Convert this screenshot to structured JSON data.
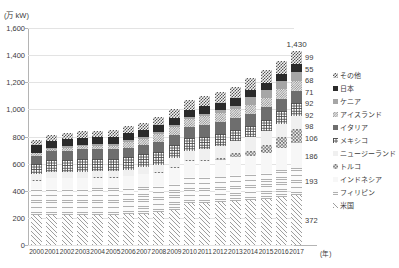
{
  "top_bleed_text": "",
  "axis": {
    "y_unit_label": "(万 kW)",
    "x_unit_label": "(年)",
    "y_ticks": [
      "0",
      "200",
      "400",
      "600",
      "800",
      "1,000",
      "1,200",
      "1,400",
      "1,600"
    ]
  },
  "annotations": {
    "total_2017": "1,430"
  },
  "legend": {
    "items": [
      {
        "label": "その他",
        "swatch": "p-sonota"
      },
      {
        "label": "日本",
        "swatch": "p-nihon"
      },
      {
        "label": "ケニア",
        "swatch": "p-kenya"
      },
      {
        "label": "アイスランド",
        "swatch": "p-iceland"
      },
      {
        "label": "イタリア",
        "swatch": "p-italy"
      },
      {
        "label": "メキシコ",
        "swatch": "p-mexico"
      },
      {
        "label": "ニュージーランド",
        "swatch": "p-nz"
      },
      {
        "label": "トルコ",
        "swatch": "p-turkey"
      },
      {
        "label": "インドネシア",
        "swatch": "p-indonesia"
      },
      {
        "label": "フィリピン",
        "swatch": "p-philippines"
      },
      {
        "label": "米国",
        "swatch": "p-usa"
      }
    ]
  },
  "callouts_2017": [
    "99",
    "55",
    "68",
    "71",
    "92",
    "92",
    "98",
    "106",
    "186",
    "193",
    "372"
  ],
  "chart_data": {
    "type": "bar",
    "title": "",
    "subtitle": "",
    "xlabel": "(年)",
    "ylabel": "(万 kW)",
    "ylim": [
      0,
      1600
    ],
    "ytick_step": 200,
    "grid": true,
    "stacked": true,
    "legend_position": "right",
    "categories": [
      "2000",
      "2001",
      "2002",
      "2003",
      "2004",
      "2005",
      "2006",
      "2007",
      "2008",
      "2009",
      "2010",
      "2011",
      "2012",
      "2013",
      "2014",
      "2015",
      "2016",
      "2017"
    ],
    "series": [
      {
        "name": "米国",
        "swatch": "p-usa",
        "values": [
          223,
          223,
          223,
          223,
          224,
          224,
          228,
          232,
          240,
          257,
          310,
          310,
          314,
          324,
          332,
          342,
          357,
          372
        ]
      },
      {
        "name": "フィリピン",
        "swatch": "p-philippines",
        "values": [
          193,
          193,
          193,
          193,
          193,
          193,
          193,
          193,
          193,
          193,
          190,
          190,
          190,
          190,
          190,
          192,
          193,
          193
        ]
      },
      {
        "name": "インドネシア",
        "swatch": "p-indonesia",
        "values": [
          59,
          79,
          79,
          79,
          80,
          80,
          85,
          99,
          99,
          119,
          119,
          119,
          124,
          134,
          134,
          144,
          164,
          186
        ]
      },
      {
        "name": "トルコ",
        "swatch": "p-turkey",
        "values": [
          2,
          2,
          2,
          2,
          2,
          2,
          2,
          2,
          3,
          8,
          9,
          11,
          16,
          31,
          41,
          62,
          82,
          106
        ]
      },
      {
        "name": "ニュージーランド",
        "swatch": "p-nz",
        "values": [
          44,
          44,
          44,
          44,
          44,
          44,
          44,
          47,
          57,
          63,
          63,
          77,
          84,
          89,
          97,
          98,
          98,
          98
        ]
      },
      {
        "name": "メキシコ",
        "swatch": "p-mexico",
        "values": [
          76,
          84,
          84,
          95,
          95,
          95,
          95,
          95,
          96,
          96,
          96,
          89,
          89,
          82,
          82,
          87,
          92,
          92
        ]
      },
      {
        "name": "イタリア",
        "swatch": "p-italy",
        "values": [
          63,
          69,
          71,
          71,
          71,
          71,
          71,
          71,
          71,
          74,
          84,
          88,
          88,
          88,
          92,
          92,
          92,
          92
        ]
      },
      {
        "name": "アイスランド",
        "swatch": "p-iceland",
        "values": [
          17,
          17,
          20,
          20,
          20,
          20,
          42,
          42,
          57,
          57,
          57,
          66,
          66,
          66,
          66,
          66,
          71,
          71
        ]
      },
      {
        "name": "ケニア",
        "swatch": "p-kenya",
        "values": [
          5,
          5,
          12,
          12,
          13,
          13,
          13,
          13,
          17,
          17,
          17,
          20,
          25,
          25,
          59,
          60,
          63,
          68
        ]
      },
      {
        "name": "日本",
        "swatch": "p-nihon",
        "values": [
          53,
          53,
          53,
          53,
          53,
          53,
          53,
          53,
          53,
          53,
          54,
          54,
          54,
          52,
          52,
          52,
          53,
          55
        ]
      },
      {
        "name": "その他",
        "swatch": "p-sonota",
        "values": [
          43,
          43,
          47,
          47,
          48,
          50,
          54,
          56,
          60,
          66,
          70,
          76,
          82,
          88,
          90,
          93,
          96,
          99
        ]
      }
    ],
    "totals": [
      778,
      812,
      828,
      839,
      843,
      845,
      880,
      903,
      946,
      1003,
      1069,
      1100,
      1132,
      1169,
      1235,
      1288,
      1361,
      1430
    ]
  }
}
